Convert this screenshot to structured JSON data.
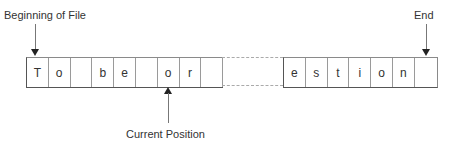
{
  "diagram": {
    "type": "file-pointer-diagram",
    "labels": {
      "beginning": "Beginning of File",
      "end": "End",
      "current": "Current Position"
    },
    "left_cells": [
      "T",
      "o",
      "",
      "b",
      "e",
      "",
      "o",
      "r",
      ""
    ],
    "right_cells": [
      "e",
      "s",
      "t",
      "i",
      "o",
      "n",
      ""
    ],
    "gap": "dashed ellipsis segment"
  }
}
